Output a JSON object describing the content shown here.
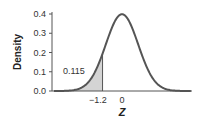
{
  "chart_data": {
    "type": "area",
    "title": "",
    "xlabel": "Z",
    "ylabel": "Density",
    "ylim": [
      0.0,
      0.4
    ],
    "yticks": [
      "0.0",
      "0.1",
      "0.2",
      "0.3",
      "0.4"
    ],
    "xticks": [
      "-1.2",
      "0"
    ],
    "xtick_values": [
      -1.2,
      0
    ],
    "series": [
      {
        "name": "Standard normal density",
        "distribution": "N(0,1)"
      }
    ],
    "shaded_region": {
      "from": "-inf",
      "to": -1.2,
      "area": 0.115
    },
    "annotations": [
      "0.115"
    ],
    "grid": false,
    "legend": "none"
  },
  "labels": {
    "ylabel": "Density",
    "xlabel": "Z",
    "area": "0.115",
    "yticks": [
      "0.0",
      "0.1",
      "0.2",
      "0.3",
      "0.4"
    ],
    "xtick_neg": "−1.2",
    "xtick_zero": "0"
  }
}
